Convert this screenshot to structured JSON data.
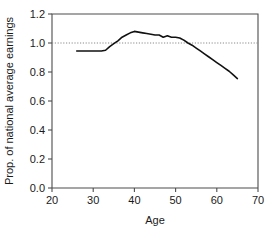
{
  "chart_data": {
    "type": "line",
    "title": "",
    "subtitle": "",
    "xlabel": "Age",
    "ylabel": "Prop. of national average earnings",
    "xlim": [
      20,
      70
    ],
    "ylim": [
      0.0,
      1.2
    ],
    "xticks": [
      20,
      30,
      40,
      50,
      60,
      70
    ],
    "xtick_labels": [
      "20",
      "30",
      "40",
      "50",
      "60",
      "70"
    ],
    "yticks": [
      0.0,
      0.2,
      0.4,
      0.6,
      0.8,
      1.0,
      1.2
    ],
    "ytick_labels": [
      "0.0",
      "0.2",
      "0.4",
      "0.6",
      "0.8",
      "1.0",
      "1.2"
    ],
    "grid": false,
    "legend": false,
    "legend_position": "none",
    "annotations": [
      {
        "name": "reference-line",
        "kind": "horizontal-dotted-line",
        "y": 1.0,
        "label": "1.0"
      }
    ],
    "series": [
      {
        "name": "Proportion of national average earnings by age",
        "color": "#111111",
        "style": "solid",
        "x": [
          26,
          27,
          28,
          29,
          30,
          31,
          32,
          33,
          34,
          35,
          36,
          37,
          38,
          39,
          40,
          41,
          42,
          43,
          44,
          45,
          46,
          47,
          48,
          49,
          50,
          51,
          52,
          53,
          54,
          55,
          56,
          57,
          58,
          59,
          60,
          61,
          62,
          63,
          64,
          65
        ],
        "y": [
          0.945,
          0.945,
          0.945,
          0.945,
          0.945,
          0.945,
          0.945,
          0.95,
          0.975,
          0.995,
          1.015,
          1.04,
          1.055,
          1.07,
          1.08,
          1.075,
          1.07,
          1.065,
          1.06,
          1.055,
          1.055,
          1.04,
          1.05,
          1.04,
          1.04,
          1.035,
          1.02,
          1.0,
          0.985,
          0.965,
          0.945,
          0.925,
          0.905,
          0.885,
          0.865,
          0.845,
          0.825,
          0.805,
          0.78,
          0.755
        ]
      }
    ],
    "axis_colors": {
      "frame": "#4d4d4d",
      "series": "#111111",
      "reference": "#8a8a8a",
      "text": "#1a1a1a"
    }
  }
}
